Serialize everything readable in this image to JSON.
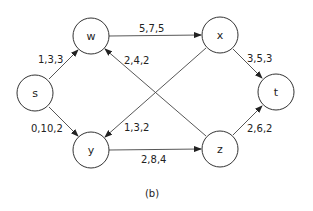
{
  "caption": "(b)",
  "nodes": [
    {
      "id": "s",
      "label": "s",
      "cx": 35,
      "cy": 93
    },
    {
      "id": "w",
      "label": "w",
      "cx": 91,
      "cy": 36
    },
    {
      "id": "x",
      "label": "x",
      "cx": 220,
      "cy": 35
    },
    {
      "id": "t",
      "label": "t",
      "cx": 276,
      "cy": 92
    },
    {
      "id": "y",
      "label": "y",
      "cx": 91,
      "cy": 150
    },
    {
      "id": "z",
      "label": "z",
      "cx": 220,
      "cy": 149
    }
  ],
  "edges": [
    {
      "from": "s",
      "to": "w",
      "label": "1,3,3"
    },
    {
      "from": "w",
      "to": "x",
      "label": "5,7,5"
    },
    {
      "from": "x",
      "to": "t",
      "label": "3,5,3"
    },
    {
      "from": "s",
      "to": "y",
      "label": "0,10,2"
    },
    {
      "from": "y",
      "to": "z",
      "label": "2,8,4"
    },
    {
      "from": "z",
      "to": "t",
      "label": "2,6,2"
    },
    {
      "from": "z",
      "to": "w",
      "label": "2,4,2"
    },
    {
      "from": "x",
      "to": "y",
      "label": "1,3,2"
    }
  ]
}
